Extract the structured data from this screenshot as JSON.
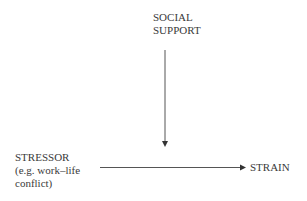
{
  "diagram": {
    "nodes": {
      "social_support": {
        "line1": "SOCIAL",
        "line2": "SUPPORT"
      },
      "stressor": {
        "line1": "STRESSOR",
        "line2": "(e.g. work–life",
        "line3": "conflict)"
      },
      "strain": {
        "line1": "STRAIN"
      }
    },
    "edges": [
      {
        "from": "stressor",
        "to": "strain",
        "direction": "right"
      },
      {
        "from": "social_support",
        "to": "stressor-strain edge",
        "direction": "down"
      }
    ],
    "colors": {
      "line": "#555555",
      "text": "#3a3a3a"
    }
  }
}
